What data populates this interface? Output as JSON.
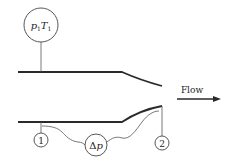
{
  "diagram": {
    "type": "nozzle-flow-measurement",
    "inlet_sensor": {
      "label_p": "p",
      "label_p_sub": "1",
      "label_T": "T",
      "label_T_sub": "1"
    },
    "taps": [
      {
        "id": "tap-1",
        "label": "1"
      },
      {
        "id": "tap-2",
        "label": "2"
      }
    ],
    "differential_gauge": {
      "label_delta": "Δ",
      "label_p": "p"
    },
    "flow": {
      "label": "Flow",
      "direction": "right"
    },
    "colors": {
      "stroke": "#2a2a2a",
      "background": "#ffffff"
    }
  }
}
